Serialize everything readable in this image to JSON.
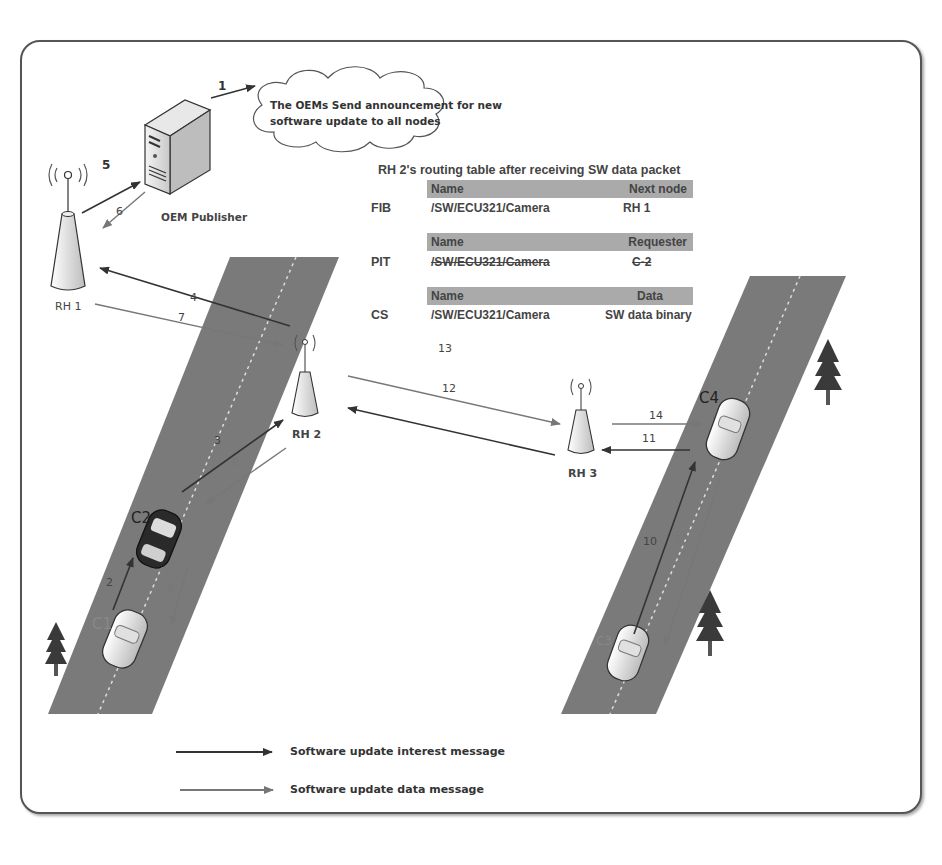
{
  "diagram": {
    "title": "RH 2's routing table after receiving SW data packet",
    "cloud": {
      "text_line1": "The OEMs Send announcement for new",
      "text_line2": "software update to all nodes"
    },
    "nodes": {
      "oem_publisher": "OEM Publisher",
      "rh1": "RH 1",
      "rh2": "RH 2",
      "rh3": "RH 3",
      "c1": "C1",
      "c2": "C2",
      "c3": "C3",
      "c4": "C4"
    },
    "step_numbers": {
      "s1": "1",
      "s2": "2",
      "s3": "3",
      "s4": "4",
      "s5": "5",
      "s6": "6",
      "s7": "7",
      "s8": "8",
      "s9": "9",
      "s10": "10",
      "s11": "11",
      "s12": "12",
      "s13": "13",
      "s14": "14",
      "s15": "15"
    },
    "routing_table": {
      "fib": {
        "label": "FIB",
        "header": {
          "name": "Name",
          "value": "Next node"
        },
        "row": {
          "name": "/SW/ECU321/Camera",
          "value": "RH 1"
        }
      },
      "pit": {
        "label": "PIT",
        "header": {
          "name": "Name",
          "value": "Requester"
        },
        "row": {
          "name": "/SW/ECU321/Camera",
          "value": "C-2",
          "struck_out": true
        }
      },
      "cs": {
        "label": "CS",
        "header": {
          "name": "Name",
          "value": "Data"
        },
        "row": {
          "name": "/SW/ECU321/Camera",
          "value": "SW data binary"
        }
      }
    },
    "legend": [
      {
        "label": "Software update interest message",
        "color": "#333333"
      },
      {
        "label": "Software update data message",
        "color": "#777777"
      }
    ],
    "colors": {
      "road": "#7a7a7a",
      "interest_arrow": "#333333",
      "data_arrow": "#777777",
      "table_header": "#aaaaaa",
      "tree": "#3a3a3a"
    }
  }
}
